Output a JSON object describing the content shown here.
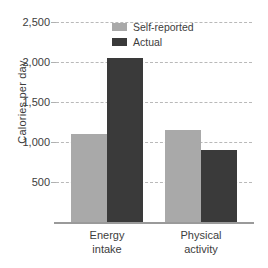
{
  "chart_data": {
    "type": "bar",
    "title": "",
    "xlabel": "",
    "ylabel": "Calories per day",
    "categories": [
      "Energy intake",
      "Physical activity"
    ],
    "category_lines": [
      [
        "Energy",
        "intake"
      ],
      [
        "Physical",
        "activity"
      ]
    ],
    "series": [
      {
        "name": "Self-reported",
        "color": "#a9a9a9",
        "values": [
          1100,
          1150
        ]
      },
      {
        "name": "Actual",
        "color": "#3a3a3a",
        "values": [
          2050,
          900
        ]
      }
    ],
    "ylim": [
      0,
      2600
    ],
    "yticks": [
      500,
      1000,
      1500,
      2000,
      2500
    ],
    "ytick_labels": [
      "500",
      "1,000",
      "1,500",
      "2,000",
      "2,500"
    ],
    "grid": "horizontal-dashed",
    "legend_position": "top-center-inside",
    "background": "#ffffff",
    "grid_color": "#b9b9b9",
    "axis_color": "#9a9a9a",
    "text_color": "#3d3d3d"
  }
}
